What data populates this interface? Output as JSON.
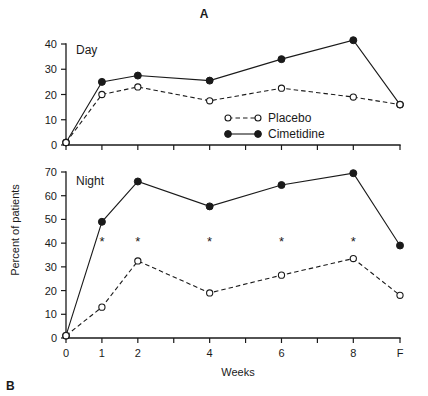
{
  "figure": {
    "top_letter": "A",
    "bottom_letter": "B",
    "y_axis_title": "Percent of patients",
    "x_axis_title": "Weeks"
  },
  "legend": {
    "position": "middle-right",
    "entries": [
      {
        "label": "Placebo",
        "marker": "open-circle",
        "line": "dashed"
      },
      {
        "label": "Cimetidine",
        "marker": "filled-circle",
        "line": "solid"
      }
    ]
  },
  "annotations": {
    "significance_marker": "*",
    "significance_weeks": [
      "1",
      "2",
      "4",
      "6",
      "8"
    ]
  },
  "chart_data": [
    {
      "type": "line",
      "title": "A",
      "panel_label": "Day",
      "xlabel": "Weeks",
      "ylabel": "Percent of patients",
      "categories": [
        "0",
        "1",
        "2",
        "4",
        "6",
        "8",
        "F"
      ],
      "x": [
        0,
        1,
        2,
        4,
        6,
        8,
        9.3
      ],
      "xlim": [
        0,
        9.3
      ],
      "ylim": [
        0,
        40
      ],
      "yticks": [
        0,
        10,
        20,
        30,
        40
      ],
      "xticks": [
        "0",
        "1",
        "2",
        "3",
        "4",
        "5",
        "6",
        "7",
        "8",
        "F"
      ],
      "grid": false,
      "legend": "inside-lower-right",
      "series": [
        {
          "name": "Cimetidine",
          "marker": "filled-circle",
          "line": "solid",
          "values": [
            1,
            25,
            27.5,
            25.5,
            34,
            41.5,
            16
          ]
        },
        {
          "name": "Placebo",
          "marker": "open-circle",
          "line": "dashed",
          "values": [
            1,
            20,
            23,
            17.5,
            22.5,
            19,
            16
          ]
        }
      ]
    },
    {
      "type": "line",
      "title": "B",
      "panel_label": "Night",
      "xlabel": "Weeks",
      "ylabel": "Percent of patients",
      "categories": [
        "0",
        "1",
        "2",
        "4",
        "6",
        "8",
        "F"
      ],
      "x": [
        0,
        1,
        2,
        4,
        6,
        8,
        9.3
      ],
      "xlim": [
        0,
        9.3
      ],
      "ylim": [
        0,
        70
      ],
      "yticks": [
        0,
        10,
        20,
        30,
        40,
        50,
        60,
        70
      ],
      "xticks": [
        "0",
        "1",
        "2",
        "3",
        "4",
        "5",
        "6",
        "7",
        "8",
        "F"
      ],
      "grid": false,
      "legend": "none",
      "series": [
        {
          "name": "Cimetidine",
          "marker": "filled-circle",
          "line": "solid",
          "values": [
            1,
            49,
            66,
            55.5,
            64.5,
            69.5,
            39
          ]
        },
        {
          "name": "Placebo",
          "marker": "open-circle",
          "line": "dashed",
          "values": [
            1,
            13,
            32.5,
            19,
            26.5,
            33.5,
            18
          ]
        }
      ],
      "significance": {
        "marker": "*",
        "at_x": [
          1,
          2,
          4,
          6,
          8
        ],
        "at_y": 41
      }
    }
  ]
}
